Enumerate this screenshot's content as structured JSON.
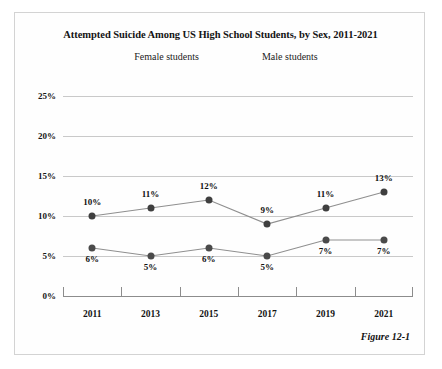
{
  "figure": {
    "caption": "Figure 12-1"
  },
  "chart_data": {
    "type": "line",
    "title": "Attempted Suicide Among US High School Students, by Sex, 2011-2021",
    "xlabel": "",
    "ylabel": "",
    "categories": [
      "2011",
      "2013",
      "2015",
      "2017",
      "2019",
      "2021"
    ],
    "ytick_labels": [
      "0%",
      "5%",
      "10%",
      "15%",
      "20%",
      "25%"
    ],
    "ytick_values": [
      0,
      5,
      10,
      15,
      20,
      25
    ],
    "ylim": [
      0,
      25
    ],
    "grid": true,
    "legend_position": "top-center",
    "series": [
      {
        "name": "Female students",
        "color": "#3f3f3f",
        "line_color": "#8f8f8f",
        "values": [
          10,
          11,
          12,
          9,
          11,
          13
        ],
        "labels": [
          "10%",
          "11%",
          "12%",
          "9%",
          "11%",
          "13%"
        ]
      },
      {
        "name": "Male students",
        "color": "#4a4a4a",
        "line_color": "#8f8f8f",
        "values": [
          6,
          5,
          6,
          5,
          7,
          7
        ],
        "labels": [
          "6%",
          "5%",
          "6%",
          "5%",
          "7%",
          "7%"
        ]
      }
    ]
  }
}
